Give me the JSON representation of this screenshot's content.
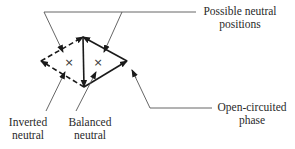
{
  "diagram": {
    "labels": {
      "possible_neutral": [
        "Possible neutral",
        "positions"
      ],
      "inverted_neutral": [
        "Inverted",
        "neutral"
      ],
      "balanced_neutral": [
        "Balanced",
        "neutral"
      ],
      "open_circuited": [
        "Open-circuited",
        "phase"
      ]
    },
    "markers": {
      "inverted_neutral_symbol": "×",
      "balanced_neutral_symbol": "×"
    },
    "colors": {
      "line": "#1a1a1a",
      "leader": "#555555",
      "text": "#2a2a2a"
    }
  }
}
